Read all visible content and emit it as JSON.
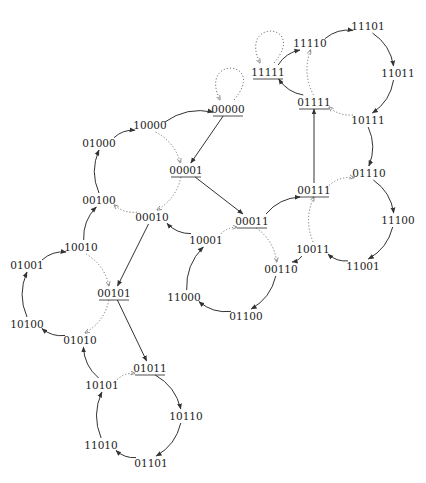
{
  "diagram": {
    "type": "state-transition-graph",
    "nodes": [
      {
        "id": "00000",
        "x": 228,
        "y": 109,
        "underlined": true
      },
      {
        "id": "10000",
        "x": 150,
        "y": 125,
        "underlined": false
      },
      {
        "id": "01000",
        "x": 99,
        "y": 143,
        "underlined": false
      },
      {
        "id": "00001",
        "x": 186,
        "y": 170,
        "underlined": true
      },
      {
        "id": "00100",
        "x": 99,
        "y": 200,
        "underlined": false
      },
      {
        "id": "00010",
        "x": 152,
        "y": 217,
        "underlined": false
      },
      {
        "id": "10001",
        "x": 206,
        "y": 240,
        "underlined": false
      },
      {
        "id": "00011",
        "x": 252,
        "y": 221,
        "underlined": true
      },
      {
        "id": "10010",
        "x": 81,
        "y": 247,
        "underlined": false
      },
      {
        "id": "01001",
        "x": 27,
        "y": 265,
        "underlined": false
      },
      {
        "id": "00101",
        "x": 114,
        "y": 293,
        "underlined": true
      },
      {
        "id": "11000",
        "x": 184,
        "y": 297,
        "underlined": false
      },
      {
        "id": "10100",
        "x": 27,
        "y": 324,
        "underlined": false
      },
      {
        "id": "01010",
        "x": 80,
        "y": 340,
        "underlined": false
      },
      {
        "id": "01100",
        "x": 246,
        "y": 316,
        "underlined": false
      },
      {
        "id": "01011",
        "x": 150,
        "y": 368,
        "underlined": true
      },
      {
        "id": "10101",
        "x": 102,
        "y": 385,
        "underlined": false
      },
      {
        "id": "10110",
        "x": 186,
        "y": 416,
        "underlined": false
      },
      {
        "id": "11010",
        "x": 101,
        "y": 445,
        "underlined": false
      },
      {
        "id": "01101",
        "x": 151,
        "y": 463,
        "underlined": false
      },
      {
        "id": "00110",
        "x": 281,
        "y": 269,
        "underlined": false
      },
      {
        "id": "10011",
        "x": 313,
        "y": 249,
        "underlined": false
      },
      {
        "id": "00111",
        "x": 314,
        "y": 190,
        "underlined": true
      },
      {
        "id": "01110",
        "x": 369,
        "y": 173,
        "underlined": false
      },
      {
        "id": "11100",
        "x": 398,
        "y": 220,
        "underlined": false
      },
      {
        "id": "11001",
        "x": 363,
        "y": 266,
        "underlined": false
      },
      {
        "id": "01111",
        "x": 314,
        "y": 102,
        "underlined": true
      },
      {
        "id": "10111",
        "x": 368,
        "y": 120,
        "underlined": false
      },
      {
        "id": "11011",
        "x": 398,
        "y": 73,
        "underlined": false
      },
      {
        "id": "11101",
        "x": 368,
        "y": 26,
        "underlined": false
      },
      {
        "id": "11110",
        "x": 310,
        "y": 43,
        "underlined": false
      },
      {
        "id": "11111",
        "x": 268,
        "y": 72,
        "underlined": true
      }
    ],
    "edges": [
      {
        "from": "00000",
        "to": "00000",
        "style": "dotted",
        "kind": "self-loop"
      },
      {
        "from": "11111",
        "to": "11111",
        "style": "dotted",
        "kind": "self-loop"
      },
      {
        "from": "00000",
        "to": "00001",
        "style": "solid"
      },
      {
        "from": "10000",
        "to": "00000",
        "style": "solid"
      },
      {
        "from": "10000",
        "to": "00001",
        "style": "dotted"
      },
      {
        "from": "01000",
        "to": "10000",
        "style": "solid"
      },
      {
        "from": "00100",
        "to": "01000",
        "style": "solid"
      },
      {
        "from": "00001",
        "to": "00010",
        "style": "dotted"
      },
      {
        "from": "00001",
        "to": "00011",
        "style": "solid"
      },
      {
        "from": "00010",
        "to": "00100",
        "style": "dotted"
      },
      {
        "from": "00010",
        "to": "00101",
        "style": "solid"
      },
      {
        "from": "10001",
        "to": "00010",
        "style": "solid"
      },
      {
        "from": "10001",
        "to": "00011",
        "style": "dotted"
      },
      {
        "from": "11000",
        "to": "10001",
        "style": "solid"
      },
      {
        "from": "01100",
        "to": "11000",
        "style": "solid"
      },
      {
        "from": "00110",
        "to": "01100",
        "style": "solid"
      },
      {
        "from": "00011",
        "to": "00110",
        "style": "dotted"
      },
      {
        "from": "00011",
        "to": "00111",
        "style": "solid"
      },
      {
        "from": "10010",
        "to": "00100",
        "style": "solid"
      },
      {
        "from": "10010",
        "to": "00101",
        "style": "dotted"
      },
      {
        "from": "01001",
        "to": "10010",
        "style": "solid"
      },
      {
        "from": "10100",
        "to": "01001",
        "style": "solid"
      },
      {
        "from": "01010",
        "to": "10100",
        "style": "solid"
      },
      {
        "from": "00101",
        "to": "01010",
        "style": "dotted"
      },
      {
        "from": "00101",
        "to": "01011",
        "style": "solid"
      },
      {
        "from": "10101",
        "to": "01010",
        "style": "solid"
      },
      {
        "from": "10101",
        "to": "01011",
        "style": "dotted"
      },
      {
        "from": "11010",
        "to": "10101",
        "style": "solid"
      },
      {
        "from": "01101",
        "to": "11010",
        "style": "solid"
      },
      {
        "from": "10110",
        "to": "01101",
        "style": "solid"
      },
      {
        "from": "01011",
        "to": "10110",
        "style": "solid"
      },
      {
        "from": "10011",
        "to": "00110",
        "style": "solid"
      },
      {
        "from": "10011",
        "to": "00111",
        "style": "dotted"
      },
      {
        "from": "11001",
        "to": "10011",
        "style": "solid"
      },
      {
        "from": "11100",
        "to": "11001",
        "style": "solid"
      },
      {
        "from": "01110",
        "to": "11100",
        "style": "solid"
      },
      {
        "from": "00111",
        "to": "01110",
        "style": "dotted"
      },
      {
        "from": "00111",
        "to": "01111",
        "style": "solid"
      },
      {
        "from": "10111",
        "to": "01110",
        "style": "solid"
      },
      {
        "from": "10111",
        "to": "01111",
        "style": "dotted"
      },
      {
        "from": "11011",
        "to": "10111",
        "style": "solid"
      },
      {
        "from": "11101",
        "to": "11011",
        "style": "solid"
      },
      {
        "from": "11110",
        "to": "11101",
        "style": "solid"
      },
      {
        "from": "01111",
        "to": "11110",
        "style": "dotted"
      },
      {
        "from": "01111",
        "to": "11111",
        "style": "solid"
      },
      {
        "from": "11111",
        "to": "11110",
        "style": "solid"
      }
    ]
  }
}
